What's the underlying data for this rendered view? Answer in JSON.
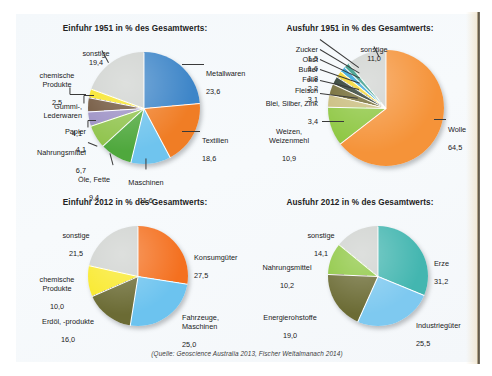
{
  "page": {
    "source_note": "(Quelle: Geoscience Australia 2013, Fischer Weltalmanach 2014)"
  },
  "chart_data": [
    {
      "id": "einfuhr-1951",
      "type": "pie",
      "title": "Einfuhr 1951 in % des Gesamtwerts:",
      "unit": "%",
      "position": "top-left",
      "labels": [
        "Metallwaren",
        "Textilien",
        "Maschinen",
        "Öle, Fette",
        "Nahrungsmittel",
        "Papier",
        "Gummi-,\nLederwaren",
        "chemische\nProdukte",
        "sonstige"
      ],
      "values": [
        23.6,
        18.6,
        11.6,
        9.4,
        6.7,
        4.1,
        4.1,
        2.5,
        19.4
      ],
      "value_text": [
        "23,6",
        "18,6",
        "11,6",
        "9,4",
        "6,7",
        "4,1",
        "4,1",
        "2,5",
        "19,4"
      ],
      "colors": [
        "#3d85c8",
        "#f07d25",
        "#6fc4ee",
        "#4fa83d",
        "#8fc34b",
        "#9b8fc4",
        "#6d5138",
        "#f7e41f",
        "#cfd2cf"
      ]
    },
    {
      "id": "ausfuhr-1951",
      "type": "pie",
      "title": "Ausfuhr 1951 in % des Gesamtwerts:",
      "unit": "%",
      "position": "top-right",
      "labels": [
        "Wolle",
        "Weizen,\nWeizenmehl",
        "Blei, Silber, Zink",
        "Fleisch",
        "Felle",
        "Butter",
        "Obst",
        "Zucker",
        "sonstige"
      ],
      "values": [
        64.5,
        10.9,
        3.4,
        3.1,
        2.2,
        1.8,
        1.6,
        1.5,
        11.0
      ],
      "value_text": [
        "64,5",
        "10,9",
        "3,4",
        "3,1",
        "2,2",
        "1,8",
        "1,6",
        "1,5",
        "11,0"
      ],
      "colors": [
        "#f59339",
        "#8cc63f",
        "#c8bb7a",
        "#6b6329",
        "#1d2e22",
        "#f4d21a",
        "#1c9ad6",
        "#1f8f7a",
        "#cfd2cf"
      ]
    },
    {
      "id": "einfuhr-2012",
      "type": "pie",
      "title": "Einfuhr 2012 in % des Gesamtwerts:",
      "unit": "%",
      "position": "bottom-left",
      "labels": [
        "Konsumgüter",
        "Fahrzeuge,\nMaschinen",
        "Erdöl, -produkte",
        "chemische\nProdukte",
        "sonstige"
      ],
      "values": [
        27.5,
        25.0,
        16.0,
        10.0,
        21.5
      ],
      "value_text": [
        "27,5",
        "25,0",
        "16,0",
        "10,0",
        "21,5"
      ],
      "colors": [
        "#f4701f",
        "#6cc3ef",
        "#6b6b34",
        "#f9e92a",
        "#cfd2cf"
      ]
    },
    {
      "id": "ausfuhr-2012",
      "type": "pie",
      "title": "Ausfuhr 2012 in % des Gesamtwerts:",
      "unit": "%",
      "position": "bottom-right",
      "labels": [
        "Erze",
        "Industriegüter",
        "Energierohstoffe",
        "Nahrungsmittel",
        "sonstige"
      ],
      "values": [
        31.2,
        25.5,
        19.0,
        10.2,
        14.1
      ],
      "value_text": [
        "31,2",
        "25,5",
        "19,0",
        "10,2",
        "14,1"
      ],
      "colors": [
        "#43b6b0",
        "#7ec9f0",
        "#6b6b34",
        "#8cc63f",
        "#cfd2cf"
      ]
    }
  ]
}
